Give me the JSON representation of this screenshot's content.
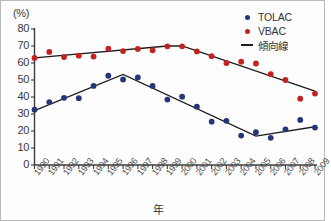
{
  "chart_data": {
    "type": "scatter",
    "title": "",
    "xlabel": "年",
    "ylabel": "(%)",
    "y_unit_label": "(%)",
    "xlim": [
      1990,
      2009
    ],
    "ylim": [
      0,
      80
    ],
    "yticks": [
      0,
      10,
      20,
      30,
      40,
      50,
      60,
      70,
      80
    ],
    "grid": false,
    "legend_position": "top-right",
    "categories": [
      "1990",
      "1991",
      "1992",
      "1993",
      "1994",
      "1995",
      "1996",
      "1997",
      "1998",
      "1999",
      "2000",
      "2001",
      "2002",
      "2003",
      "2004",
      "2005",
      "2006",
      "2007",
      "2008",
      "2009"
    ],
    "series": [
      {
        "name": "TOLAC",
        "color": "#27347a",
        "marker": "circle",
        "values": [
          32.5,
          37.0,
          39.5,
          39.3,
          46.5,
          52.5,
          50.3,
          51.5,
          46.5,
          38.5,
          40.2,
          34.3,
          25.5,
          26.0,
          17.3,
          19.3,
          16.0,
          21.0,
          26.5,
          22.0
        ]
      },
      {
        "name": "VBAC",
        "color": "#c32222",
        "marker": "circle",
        "values": [
          63.0,
          66.5,
          63.5,
          64.3,
          63.8,
          68.5,
          67.0,
          68.3,
          67.5,
          69.8,
          69.8,
          66.8,
          64.0,
          60.0,
          60.8,
          59.7,
          53.5,
          50.0,
          39.0,
          42.0
        ]
      }
    ],
    "trend_lines": [
      {
        "name": "TOLAC trend",
        "series": "TOLAC",
        "color": "#1c1c1c",
        "points": [
          {
            "x": 1990,
            "y": 32.0
          },
          {
            "x": 1996,
            "y": 53.3
          },
          {
            "x": 2005,
            "y": 17.0
          },
          {
            "x": 2009,
            "y": 22.5
          }
        ]
      },
      {
        "name": "VBAC trend",
        "series": "VBAC",
        "color": "#1c1c1c",
        "points": [
          {
            "x": 1990,
            "y": 63.0
          },
          {
            "x": 1999,
            "y": 70.0
          },
          {
            "x": 2000,
            "y": 70.0
          },
          {
            "x": 2009,
            "y": 43.5
          }
        ]
      }
    ],
    "legend": [
      {
        "label": "TOLAC",
        "marker": "dot",
        "color": "#27347a"
      },
      {
        "label": "VBAC",
        "marker": "dot",
        "color": "#c32222"
      },
      {
        "label": "傾向線",
        "marker": "line",
        "color": "#1c1c1c"
      }
    ]
  }
}
